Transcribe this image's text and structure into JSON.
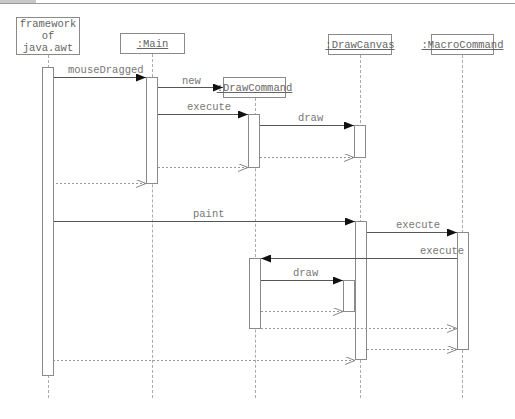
{
  "diagram": {
    "type": "UML sequence diagram",
    "participants": [
      {
        "id": "framework",
        "label": "framework\nof\njava.awt",
        "underlined": false
      },
      {
        "id": "main",
        "label": ":Main",
        "underlined": true
      },
      {
        "id": "drawcommand",
        "label": ":DrawCommand",
        "underlined": true
      },
      {
        "id": "drawcanvas",
        "label": ":DrawCanvas",
        "underlined": true
      },
      {
        "id": "macrocommand",
        "label": ":MacroCommand",
        "underlined": true
      }
    ],
    "messages": [
      {
        "from": "framework",
        "to": "main",
        "label": "mouseDragged",
        "kind": "call"
      },
      {
        "from": "main",
        "to": "drawcommand",
        "label": "new",
        "kind": "create"
      },
      {
        "from": "main",
        "to": "drawcommand",
        "label": "execute",
        "kind": "call"
      },
      {
        "from": "drawcommand",
        "to": "drawcanvas",
        "label": "draw",
        "kind": "call"
      },
      {
        "from": "drawcanvas",
        "to": "drawcommand",
        "label": "",
        "kind": "return"
      },
      {
        "from": "drawcommand",
        "to": "main",
        "label": "",
        "kind": "return"
      },
      {
        "from": "main",
        "to": "framework",
        "label": "",
        "kind": "return"
      },
      {
        "from": "framework",
        "to": "drawcanvas",
        "label": "paint",
        "kind": "call"
      },
      {
        "from": "drawcanvas",
        "to": "macrocommand",
        "label": "execute",
        "kind": "call"
      },
      {
        "from": "macrocommand",
        "to": "drawcommand",
        "label": "execute",
        "kind": "call"
      },
      {
        "from": "drawcommand",
        "to": "drawcanvas",
        "label": "draw",
        "kind": "call"
      },
      {
        "from": "drawcanvas",
        "to": "drawcommand",
        "label": "",
        "kind": "return"
      },
      {
        "from": "drawcommand",
        "to": "macrocommand",
        "label": "",
        "kind": "return"
      },
      {
        "from": "macrocommand",
        "to": "drawcanvas",
        "label": "",
        "kind": "return"
      },
      {
        "from": "drawcanvas",
        "to": "framework",
        "label": "",
        "kind": "return"
      }
    ]
  }
}
